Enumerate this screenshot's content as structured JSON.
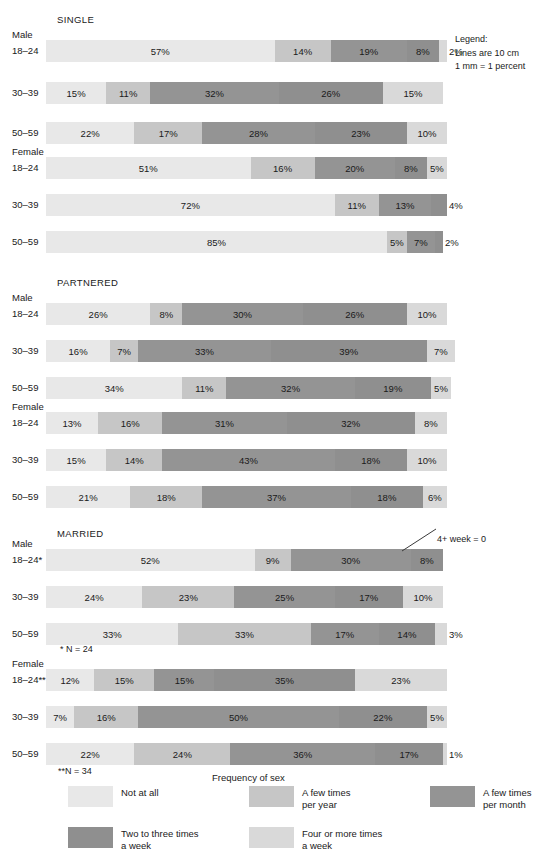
{
  "legend_note": {
    "title": "Legend:",
    "line1": "Lines are 10 cm",
    "line2": "1 mm = 1 percent"
  },
  "annotation_married_male": "4+ week = 0",
  "footnotes": {
    "single_star": "* N = 24",
    "double_star": "**N = 34"
  },
  "key": {
    "title": "Frequency of sex",
    "items": [
      {
        "label": "Not at all",
        "color": "#e8e8e8",
        "class": "c0"
      },
      {
        "label": "A few times\nper year",
        "color": "#c6c6c6",
        "class": "c1"
      },
      {
        "label": "A few times\nper month",
        "color": "#949494",
        "class": "c2"
      },
      {
        "label": "Two to three times\na week",
        "color": "#8f8f8f",
        "class": "c3"
      },
      {
        "label": "Four or more times\na week",
        "color": "#d9d9d9",
        "class": "c4"
      }
    ]
  },
  "chart_data": {
    "type": "bar",
    "orientation": "horizontal",
    "stacked": true,
    "title": "",
    "xlabel": "",
    "ylabel": "",
    "xlim": [
      0,
      100
    ],
    "units": "percent",
    "grid": false,
    "legend_position": "bottom",
    "categories": [
      "Not at all",
      "A few times per year",
      "A few times per month",
      "Two to three times a week",
      "Four or more times a week"
    ],
    "groups": [
      {
        "name": "SINGLE",
        "sexes": [
          {
            "sex": "Male",
            "rows": [
              {
                "label": "18–24",
                "values": [
                  57,
                  14,
                  19,
                  8,
                  2
                ],
                "labels": [
                  "57%",
                  "14%",
                  "19%",
                  "8%",
                  "2%"
                ]
              },
              {
                "label": "30–39",
                "values": [
                  15,
                  11,
                  32,
                  26,
                  15
                ],
                "labels": [
                  "15%",
                  "11%",
                  "32%",
                  "26%",
                  "15%"
                ]
              },
              {
                "label": "50–59",
                "values": [
                  22,
                  17,
                  28,
                  23,
                  10
                ],
                "labels": [
                  "22%",
                  "17%",
                  "28%",
                  "23%",
                  "10%"
                ]
              }
            ]
          },
          {
            "sex": "Female",
            "rows": [
              {
                "label": "18–24",
                "values": [
                  51,
                  16,
                  20,
                  8,
                  5
                ],
                "labels": [
                  "51%",
                  "16%",
                  "20%",
                  "8%",
                  "5%"
                ]
              },
              {
                "label": "30–39",
                "values": [
                  72,
                  11,
                  13,
                  4,
                  0
                ],
                "labels": [
                  "72%",
                  "11%",
                  "13%",
                  "4%",
                  ""
                ]
              },
              {
                "label": "50–59",
                "values": [
                  85,
                  5,
                  7,
                  2,
                  0
                ],
                "labels": [
                  "85%",
                  "5%",
                  "7%",
                  "2%",
                  ""
                ]
              }
            ]
          }
        ]
      },
      {
        "name": "PARTNERED",
        "sexes": [
          {
            "sex": "Male",
            "rows": [
              {
                "label": "18–24",
                "values": [
                  26,
                  8,
                  30,
                  26,
                  10
                ],
                "labels": [
                  "26%",
                  "8%",
                  "30%",
                  "26%",
                  "10%"
                ]
              },
              {
                "label": "30–39",
                "values": [
                  16,
                  7,
                  33,
                  39,
                  7
                ],
                "labels": [
                  "16%",
                  "7%",
                  "33%",
                  "39%",
                  "7%"
                ]
              },
              {
                "label": "50–59",
                "values": [
                  34,
                  11,
                  32,
                  19,
                  5
                ],
                "labels": [
                  "34%",
                  "11%",
                  "32%",
                  "19%",
                  "5%"
                ]
              }
            ]
          },
          {
            "sex": "Female",
            "rows": [
              {
                "label": "18–24",
                "values": [
                  13,
                  16,
                  31,
                  32,
                  8
                ],
                "labels": [
                  "13%",
                  "16%",
                  "31%",
                  "32%",
                  "8%"
                ]
              },
              {
                "label": "30–39",
                "values": [
                  15,
                  14,
                  43,
                  18,
                  10
                ],
                "labels": [
                  "15%",
                  "14%",
                  "43%",
                  "18%",
                  "10%"
                ]
              },
              {
                "label": "50–59",
                "values": [
                  21,
                  18,
                  37,
                  18,
                  6
                ],
                "labels": [
                  "21%",
                  "18%",
                  "37%",
                  "18%",
                  "6%"
                ]
              }
            ]
          }
        ]
      },
      {
        "name": "MARRIED",
        "sexes": [
          {
            "sex": "Male",
            "rows": [
              {
                "label": "18–24*",
                "values": [
                  52,
                  9,
                  30,
                  8,
                  0
                ],
                "labels": [
                  "52%",
                  "9%",
                  "30%",
                  "8%",
                  ""
                ]
              },
              {
                "label": "30–39",
                "values": [
                  24,
                  23,
                  25,
                  17,
                  10
                ],
                "labels": [
                  "24%",
                  "23%",
                  "25%",
                  "17%",
                  "10%"
                ]
              },
              {
                "label": "50–59",
                "values": [
                  33,
                  33,
                  17,
                  14,
                  3
                ],
                "labels": [
                  "33%",
                  "33%",
                  "17%",
                  "14%",
                  "3%"
                ]
              }
            ]
          },
          {
            "sex": "Female",
            "rows": [
              {
                "label": "18–24**",
                "values": [
                  12,
                  15,
                  15,
                  35,
                  23
                ],
                "labels": [
                  "12%",
                  "15%",
                  "15%",
                  "35%",
                  "23%"
                ]
              },
              {
                "label": "30–39",
                "values": [
                  7,
                  16,
                  50,
                  22,
                  5
                ],
                "labels": [
                  "7%",
                  "16%",
                  "50%",
                  "22%",
                  "5%"
                ]
              },
              {
                "label": "50–59",
                "values": [
                  22,
                  24,
                  36,
                  17,
                  1
                ],
                "labels": [
                  "22%",
                  "24%",
                  "36%",
                  "17%",
                  "1%"
                ]
              }
            ]
          }
        ]
      }
    ]
  }
}
